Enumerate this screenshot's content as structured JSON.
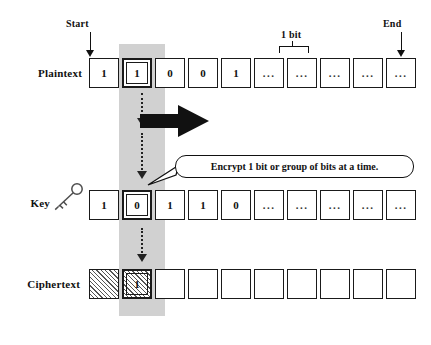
{
  "diagram": {
    "colors": {
      "ink": "#111111",
      "highlight_band": "#c9c9c9",
      "cell_fill": "#ffffff",
      "hatch": "#555555"
    },
    "markers": {
      "start_label": "Start",
      "end_label": "End",
      "bit_bracket_label": "1 bit"
    },
    "callout": {
      "text": "Encrypt 1 bit or group of bits at a time."
    },
    "rows": [
      {
        "id": "plaintext",
        "label": "Plaintext",
        "cells": [
          {
            "value": "1",
            "style": "plain",
            "selected": false
          },
          {
            "value": "1",
            "style": "plain",
            "selected": true
          },
          {
            "value": "0",
            "style": "plain",
            "selected": false
          },
          {
            "value": "0",
            "style": "plain",
            "selected": false
          },
          {
            "value": "1",
            "style": "plain",
            "selected": false
          },
          {
            "value": "...",
            "style": "ellipsis",
            "selected": false
          },
          {
            "value": "...",
            "style": "ellipsis",
            "selected": false
          },
          {
            "value": "...",
            "style": "ellipsis",
            "selected": false
          },
          {
            "value": "...",
            "style": "ellipsis",
            "selected": false
          },
          {
            "value": "...",
            "style": "ellipsis",
            "selected": false
          }
        ]
      },
      {
        "id": "key",
        "label": "Key",
        "icon": "key-icon",
        "cells": [
          {
            "value": "1",
            "style": "plain",
            "selected": false
          },
          {
            "value": "0",
            "style": "plain",
            "selected": true
          },
          {
            "value": "1",
            "style": "plain",
            "selected": false
          },
          {
            "value": "1",
            "style": "plain",
            "selected": false
          },
          {
            "value": "0",
            "style": "plain",
            "selected": false
          },
          {
            "value": "...",
            "style": "ellipsis",
            "selected": false
          },
          {
            "value": "...",
            "style": "ellipsis",
            "selected": false
          },
          {
            "value": "...",
            "style": "ellipsis",
            "selected": false
          },
          {
            "value": "...",
            "style": "ellipsis",
            "selected": false
          },
          {
            "value": "...",
            "style": "ellipsis",
            "selected": false
          }
        ]
      },
      {
        "id": "ciphertext",
        "label": "Ciphertext",
        "cells": [
          {
            "value": "",
            "style": "hatched",
            "selected": false
          },
          {
            "value": "1",
            "style": "hatched",
            "selected": true
          },
          {
            "value": "",
            "style": "empty",
            "selected": false
          },
          {
            "value": "",
            "style": "empty",
            "selected": false
          },
          {
            "value": "",
            "style": "empty",
            "selected": false
          },
          {
            "value": "",
            "style": "empty",
            "selected": false
          },
          {
            "value": "",
            "style": "empty",
            "selected": false
          },
          {
            "value": "",
            "style": "empty",
            "selected": false
          },
          {
            "value": "",
            "style": "empty",
            "selected": false
          },
          {
            "value": "",
            "style": "empty",
            "selected": false
          }
        ]
      }
    ],
    "flow_arrows": [
      {
        "id": "plaintext-to-key",
        "direction": "down",
        "style": "dashed"
      },
      {
        "id": "key-to-ciphertext",
        "direction": "down",
        "style": "dashed"
      },
      {
        "id": "stream-direction",
        "direction": "right",
        "style": "solid-thick"
      }
    ]
  }
}
